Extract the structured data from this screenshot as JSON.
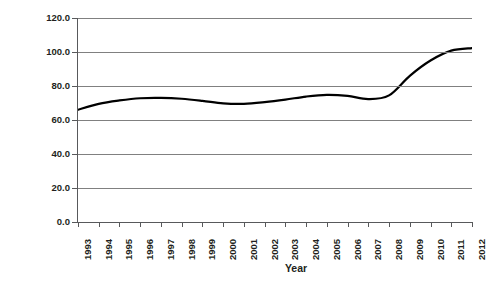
{
  "chart_data": {
    "type": "line",
    "title": "",
    "xlabel": "Year",
    "ylabel": "World Government Debt (Percent of GDP)",
    "xlim": [
      1993,
      2012
    ],
    "ylim": [
      0.0,
      120.0
    ],
    "ytick_step": 20.0,
    "grid": true,
    "legend": "none",
    "line_color": "#000000",
    "gridline_color": "#808080",
    "axis_color": "#58595b",
    "ytick_labels": [
      "0.0",
      "20.0",
      "40.0",
      "60.0",
      "80.0",
      "100.0",
      "120.0"
    ],
    "ytick_values": [
      0.0,
      20.0,
      40.0,
      60.0,
      80.0,
      100.0,
      120.0
    ],
    "categories": [
      "1993",
      "1994",
      "1995",
      "1996",
      "1997",
      "1998",
      "1999",
      "2000",
      "2001",
      "2002",
      "2003",
      "2004",
      "2005",
      "2006",
      "2007",
      "2008",
      "2009",
      "2010",
      "2011",
      "2012"
    ],
    "series": [
      {
        "name": "World Government Debt (Percent of GDP)",
        "values": [
          66.0,
          69.5,
          71.5,
          72.8,
          73.0,
          72.5,
          71.3,
          69.8,
          69.5,
          70.5,
          72.0,
          73.8,
          74.8,
          74.2,
          72.3,
          74.5,
          86.0,
          95.0,
          100.8,
          102.3
        ]
      }
    ]
  }
}
